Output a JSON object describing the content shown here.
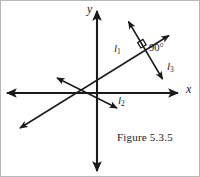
{
  "figure": {
    "caption": "Figure 5.3.5",
    "background_color": "#ffffff",
    "stroke_color": "#1a1a1a",
    "width": 200,
    "height": 177
  },
  "axes": {
    "x_label": "x",
    "y_label": "y",
    "origin": {
      "x": 96,
      "y": 92
    },
    "x_axis": {
      "from_x": 5,
      "to_x": 178,
      "y": 92,
      "arrows": "both"
    },
    "y_axis": {
      "x": 96,
      "from_y": 8,
      "to_y": 172,
      "arrows": "both"
    }
  },
  "lines": [
    {
      "name": "l1",
      "label": "l",
      "subscript": "1",
      "description": "line rising from lower-left to upper-right through the origin region",
      "from": {
        "x": 17,
        "y": 128
      },
      "to": {
        "x": 170,
        "y": 33
      },
      "arrows": "both"
    },
    {
      "name": "l2",
      "label": "l",
      "subscript": "2",
      "description": "line descending from upper-left to lower-right ending below the x-axis",
      "from": {
        "x": 54,
        "y": 76
      },
      "to": {
        "x": 118,
        "y": 108
      },
      "arrows": "both"
    },
    {
      "name": "l3",
      "label": "l",
      "subscript": "3",
      "description": "line perpendicular to l1 crossing it in the first quadrant",
      "from": {
        "x": 126,
        "y": 18
      },
      "to": {
        "x": 163,
        "y": 80
      },
      "arrows": "both"
    }
  ],
  "angle_marker": {
    "label": "90°",
    "intersection": {
      "x": 143,
      "y": 47
    },
    "between": [
      "l1",
      "l3"
    ],
    "marker_type": "right-angle-square"
  }
}
